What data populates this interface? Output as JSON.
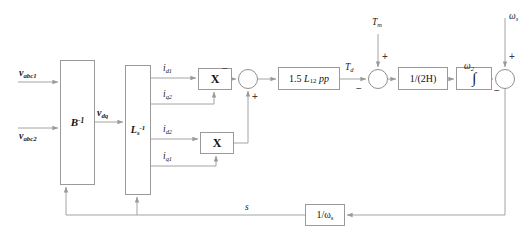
{
  "diagram": {
    "type": "control-block-diagram",
    "canvas": {
      "width": 528,
      "height": 248
    },
    "style": {
      "wire_color": "#9a9a9a",
      "block_border": "#9a9a9a",
      "background": "#ffffff",
      "text_color": "#1a1a1a"
    },
    "blocks": [
      {
        "id": "binv",
        "label": "B",
        "sup": "-1",
        "x": 60,
        "y": 60,
        "w": 35,
        "h": 125
      },
      {
        "id": "lsinv",
        "label": "L",
        "sub": "s",
        "sup": "-1",
        "x": 125,
        "y": 65,
        "w": 26,
        "h": 130
      },
      {
        "id": "mul1",
        "label": "X",
        "x": 198,
        "y": 68,
        "w": 34,
        "h": 22
      },
      {
        "id": "mul2",
        "label": "X",
        "x": 200,
        "y": 132,
        "w": 34,
        "h": 22
      },
      {
        "id": "gain15",
        "label": "1.5 L12 pp",
        "x": 278,
        "y": 67,
        "w": 62,
        "h": 23
      },
      {
        "id": "inertia",
        "label": "1/(2H)",
        "x": 398,
        "y": 67,
        "w": 50,
        "h": 23
      },
      {
        "id": "integ",
        "label": "∫",
        "x": 456,
        "y": 67,
        "w": 36,
        "h": 23
      },
      {
        "id": "invws",
        "label": "1/ωs",
        "x": 305,
        "y": 204,
        "w": 40,
        "h": 22
      }
    ],
    "sum_junctions": [
      {
        "id": "sum_torque_diff",
        "cx": 248,
        "cy": 79,
        "r": 10,
        "signs": [
          {
            "pos": "left",
            "sign": "−"
          },
          {
            "pos": "bottom",
            "sign": "+"
          }
        ]
      },
      {
        "id": "sum_tm",
        "cx": 378,
        "cy": 79,
        "r": 10,
        "signs": [
          {
            "pos": "left",
            "sign": "−"
          },
          {
            "pos": "top",
            "sign": "+"
          }
        ]
      },
      {
        "id": "sum_slip",
        "cx": 505,
        "cy": 79,
        "r": 10,
        "signs": [
          {
            "pos": "left",
            "sign": "−"
          },
          {
            "pos": "top",
            "sign": "+"
          }
        ]
      }
    ],
    "signals": {
      "v_abc1": {
        "text": "v",
        "sub": "abc1"
      },
      "v_abc2": {
        "text": "v",
        "sub": "abc2"
      },
      "v_dq": {
        "text": "v",
        "sub": "dq"
      },
      "i_d1": {
        "text": "i",
        "sub": "d1"
      },
      "i_q2": {
        "text": "i",
        "sub": "q2"
      },
      "i_d2": {
        "text": "i",
        "sub": "d2"
      },
      "i_q1": {
        "text": "i",
        "sub": "q1"
      },
      "T_d": {
        "text": "T",
        "sub": "d"
      },
      "T_m": {
        "text": "T",
        "sub": "m"
      },
      "w_2": {
        "text": "ω",
        "sub": "2"
      },
      "w_s": {
        "text": "ω",
        "sub": "s"
      },
      "slip_s": {
        "text": "s",
        "sub": ""
      }
    },
    "block_labels": {
      "binv_base": "B",
      "binv_exp": "-1",
      "lsinv_base": "L",
      "lsinv_sub": "s",
      "lsinv_exp": "-1",
      "mul_symbol": "X",
      "gain_prefix": "1.5 ",
      "gain_L": "L",
      "gain_L_sub": "12",
      "gain_pp": "pp",
      "inertia": "1/(2H)",
      "integrator": "∫",
      "invws_prefix": "1/",
      "invws_omega": "ω",
      "invws_sub": "s"
    },
    "signs": {
      "minus": "−",
      "plus": "+"
    }
  }
}
